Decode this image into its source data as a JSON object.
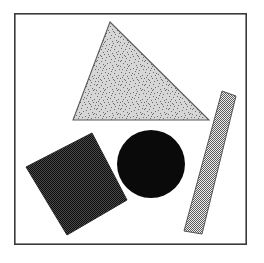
{
  "figure": {
    "title": "Geometric shapes with textured fills",
    "canvas": {
      "width": 264,
      "height": 263,
      "background_color": "#ffffff"
    },
    "frame": {
      "name": "outer-border",
      "x": 14,
      "y": 13,
      "width": 233,
      "height": 232,
      "stroke_color": "#3a3a3a",
      "stroke_width": 1.6,
      "fill_color": "#ffffff"
    },
    "shapes": [
      {
        "id": "triangle",
        "label": "Triangle",
        "kind": "polygon",
        "texture": "random-noise-stipple",
        "fill_color": "#c9c9c9",
        "noise_dot_color": "#6e6e6e",
        "stroke_color": "#5a5a5a",
        "stroke_width": 1.1,
        "points": "110,22 209,120 73,120",
        "vertices": [
          {
            "x": 110,
            "y": 22
          },
          {
            "x": 209,
            "y": 120
          },
          {
            "x": 73,
            "y": 120
          }
        ]
      },
      {
        "id": "square",
        "label": "Rotated square",
        "kind": "polygon",
        "texture": "dense-dark-checkerboard",
        "fill_color": "#3b3b3b",
        "checker_color": "#111111",
        "stroke_color": "#2a2a2a",
        "stroke_width": 1.0,
        "rotation_deg": 30,
        "points": "92,133 127,200 67,235 26,167",
        "vertices": [
          {
            "x": 92,
            "y": 133
          },
          {
            "x": 127,
            "y": 200
          },
          {
            "x": 67,
            "y": 235
          },
          {
            "x": 26,
            "y": 167
          }
        ]
      },
      {
        "id": "circle",
        "label": "Circle",
        "kind": "circle",
        "texture": "solid",
        "fill_color": "#0a0a0a",
        "stroke_color": "#0a0a0a",
        "stroke_width": 0,
        "cx": 151,
        "cy": 164,
        "r": 34
      },
      {
        "id": "bar",
        "label": "Tilted bar",
        "kind": "polygon",
        "texture": "medium-gray-checkerboard",
        "fill_color": "#8c8c8c",
        "checker_color": "#4a4a4a",
        "stroke_color": "#555555",
        "stroke_width": 1.0,
        "rotation_deg": 14,
        "points": "222,91 236,96 202,234 184,231",
        "vertices": [
          {
            "x": 222,
            "y": 91
          },
          {
            "x": 236,
            "y": 96
          },
          {
            "x": 202,
            "y": 234
          },
          {
            "x": 184,
            "y": 231
          }
        ]
      }
    ]
  }
}
